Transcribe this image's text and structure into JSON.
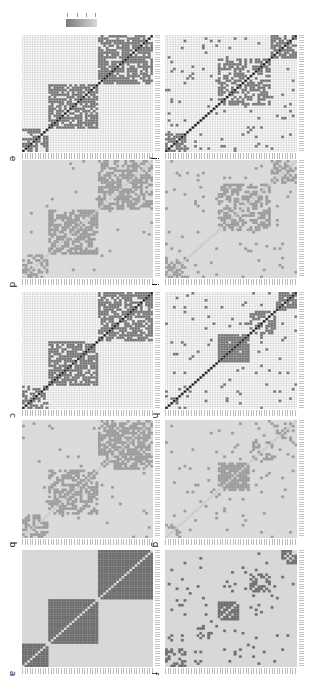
{
  "figure": {
    "colorbar": {
      "tick_labels": [
        "1",
        "0.5",
        "0",
        "-1"
      ],
      "gradient_from": "#7a7a7a",
      "gradient_to": "#d8d8d8"
    },
    "colors": {
      "background_cell": "#ffffff",
      "grid_line": "#b9b9b9",
      "filled_cell": "#6e6e6e",
      "diagonal_cell": "#111111",
      "similarity_bg": "#d9d9d9",
      "similarity_cell": "#9a9a9a",
      "solid_bg": "#d6d6d6",
      "solid_block": "#6b6b6b",
      "solid_diag": "#d6d6d6"
    },
    "panels": [
      {
        "id": "e",
        "label": "e",
        "style": "binary",
        "x": 22,
        "y": 35,
        "w": 131,
        "h": 117,
        "n": 50,
        "blocks": [
          [
            0,
            10,
            0.55
          ],
          [
            10,
            29,
            0.7
          ],
          [
            29,
            50,
            0.72
          ]
        ],
        "noise": 0.0,
        "seed": 11
      },
      {
        "id": "d",
        "label": "d",
        "style": "similarity",
        "x": 22,
        "y": 160,
        "w": 131,
        "h": 118,
        "n": 50,
        "blocks": [
          [
            0,
            10,
            0.55
          ],
          [
            10,
            29,
            0.65
          ],
          [
            29,
            50,
            0.6
          ]
        ],
        "noise": 0.01,
        "seed": 12
      },
      {
        "id": "c",
        "label": "c",
        "style": "binary",
        "x": 22,
        "y": 292,
        "w": 131,
        "h": 117,
        "n": 50,
        "blocks": [
          [
            0,
            10,
            0.55
          ],
          [
            10,
            29,
            0.72
          ],
          [
            29,
            50,
            0.72
          ]
        ],
        "noise": 0.0,
        "seed": 13
      },
      {
        "id": "b",
        "label": "b",
        "style": "similarity",
        "x": 22,
        "y": 420,
        "w": 131,
        "h": 118,
        "n": 50,
        "blocks": [
          [
            0,
            10,
            0.55
          ],
          [
            10,
            29,
            0.55
          ],
          [
            29,
            50,
            0.65
          ]
        ],
        "noise": 0.01,
        "seed": 14
      },
      {
        "id": "a",
        "label": "a",
        "style": "solid",
        "x": 22,
        "y": 550,
        "w": 131,
        "h": 117,
        "n": 50,
        "blocks": [
          [
            0,
            10,
            1.0
          ],
          [
            10,
            29,
            1.0
          ],
          [
            29,
            50,
            1.0
          ]
        ],
        "noise": 0.0,
        "seed": 15
      },
      {
        "id": "j",
        "label": "j",
        "style": "binary",
        "x": 165,
        "y": 35,
        "w": 132,
        "h": 117,
        "n": 50,
        "blocks": [
          [
            0,
            8,
            0.6
          ],
          [
            20,
            40,
            0.55
          ],
          [
            40,
            50,
            0.75
          ]
        ],
        "noise": 0.04,
        "seed": 21
      },
      {
        "id": "i",
        "label": "i",
        "style": "similarity",
        "x": 165,
        "y": 160,
        "w": 132,
        "h": 118,
        "n": 50,
        "blocks": [
          [
            0,
            8,
            0.4
          ],
          [
            20,
            40,
            0.45
          ],
          [
            40,
            50,
            0.4
          ]
        ],
        "noise": 0.04,
        "seed": 22
      },
      {
        "id": "h",
        "label": "h",
        "style": "binary",
        "x": 165,
        "y": 292,
        "w": 132,
        "h": 117,
        "n": 50,
        "blocks": [
          [
            0,
            6,
            0.3
          ],
          [
            20,
            32,
            0.95
          ],
          [
            32,
            42,
            0.5
          ],
          [
            42,
            50,
            0.6
          ]
        ],
        "noise": 0.035,
        "seed": 23
      },
      {
        "id": "g",
        "label": "g",
        "style": "similarity",
        "x": 165,
        "y": 420,
        "w": 132,
        "h": 118,
        "n": 50,
        "blocks": [
          [
            0,
            6,
            0.3
          ],
          [
            20,
            32,
            0.8
          ],
          [
            32,
            42,
            0.4
          ],
          [
            42,
            50,
            0.4
          ]
        ],
        "noise": 0.03,
        "seed": 24
      },
      {
        "id": "f",
        "label": "f",
        "style": "sparse",
        "x": 165,
        "y": 550,
        "w": 132,
        "h": 117,
        "n": 50,
        "blocks": [
          [
            0,
            8,
            0.55
          ],
          [
            12,
            18,
            0.55
          ],
          [
            20,
            28,
            0.95
          ],
          [
            32,
            40,
            0.55
          ],
          [
            44,
            50,
            0.55
          ]
        ],
        "noise": 0.04,
        "seed": 25
      }
    ]
  }
}
